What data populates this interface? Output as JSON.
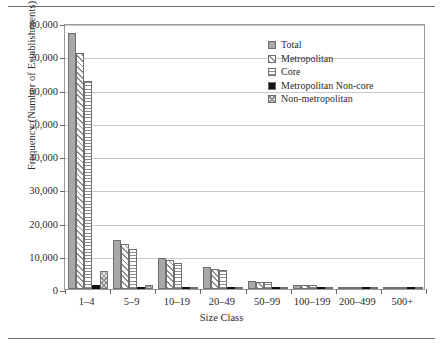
{
  "chart_data": {
    "type": "bar",
    "title": "",
    "xlabel": "Size Class",
    "ylabel": "Frequency (Number of Establishments)",
    "categories": [
      "1–4",
      "5–9",
      "10–19",
      "20–49",
      "50–99",
      "100–199",
      "200–499",
      "500+"
    ],
    "ylim": [
      0,
      80000
    ],
    "yticks": [
      0,
      10000,
      20000,
      30000,
      40000,
      50000,
      60000,
      70000,
      80000
    ],
    "ytick_labels": [
      "0",
      "10,000",
      "20,000",
      "30,000",
      "40,000",
      "50,000",
      "60,000",
      "70,000",
      "80,000"
    ],
    "grid": true,
    "legend_position": "upper-center-right",
    "series": [
      {
        "name": "Total",
        "pattern": "solid-gray",
        "color": "#a8a8a8",
        "values": [
          77000,
          14600,
          9200,
          6600,
          2400,
          1300,
          700,
          250
        ]
      },
      {
        "name": "Metropolitan",
        "pattern": "diagonal",
        "color": "#ffffff",
        "values": [
          71000,
          13600,
          8600,
          6100,
          2200,
          1200,
          650,
          230
        ]
      },
      {
        "name": "Core",
        "pattern": "horizontal",
        "color": "#ffffff",
        "values": [
          62500,
          12000,
          7900,
          5700,
          2100,
          1150,
          620,
          220
        ]
      },
      {
        "name": "Metropolitan Non-core",
        "pattern": "solid-black",
        "color": "#111111",
        "values": [
          1200,
          500,
          350,
          250,
          120,
          60,
          40,
          15
        ]
      },
      {
        "name": "Non-metropolitan",
        "pattern": "crosshatch",
        "color": "#e2e2e2",
        "values": [
          5500,
          1100,
          700,
          450,
          200,
          100,
          60,
          20
        ]
      }
    ]
  },
  "legend": {
    "items": [
      {
        "label": "Total"
      },
      {
        "label": "Metropolitan"
      },
      {
        "label": "Core"
      },
      {
        "label": "Metropolitan Non-core"
      },
      {
        "label": "Non-metropolitan"
      }
    ]
  }
}
